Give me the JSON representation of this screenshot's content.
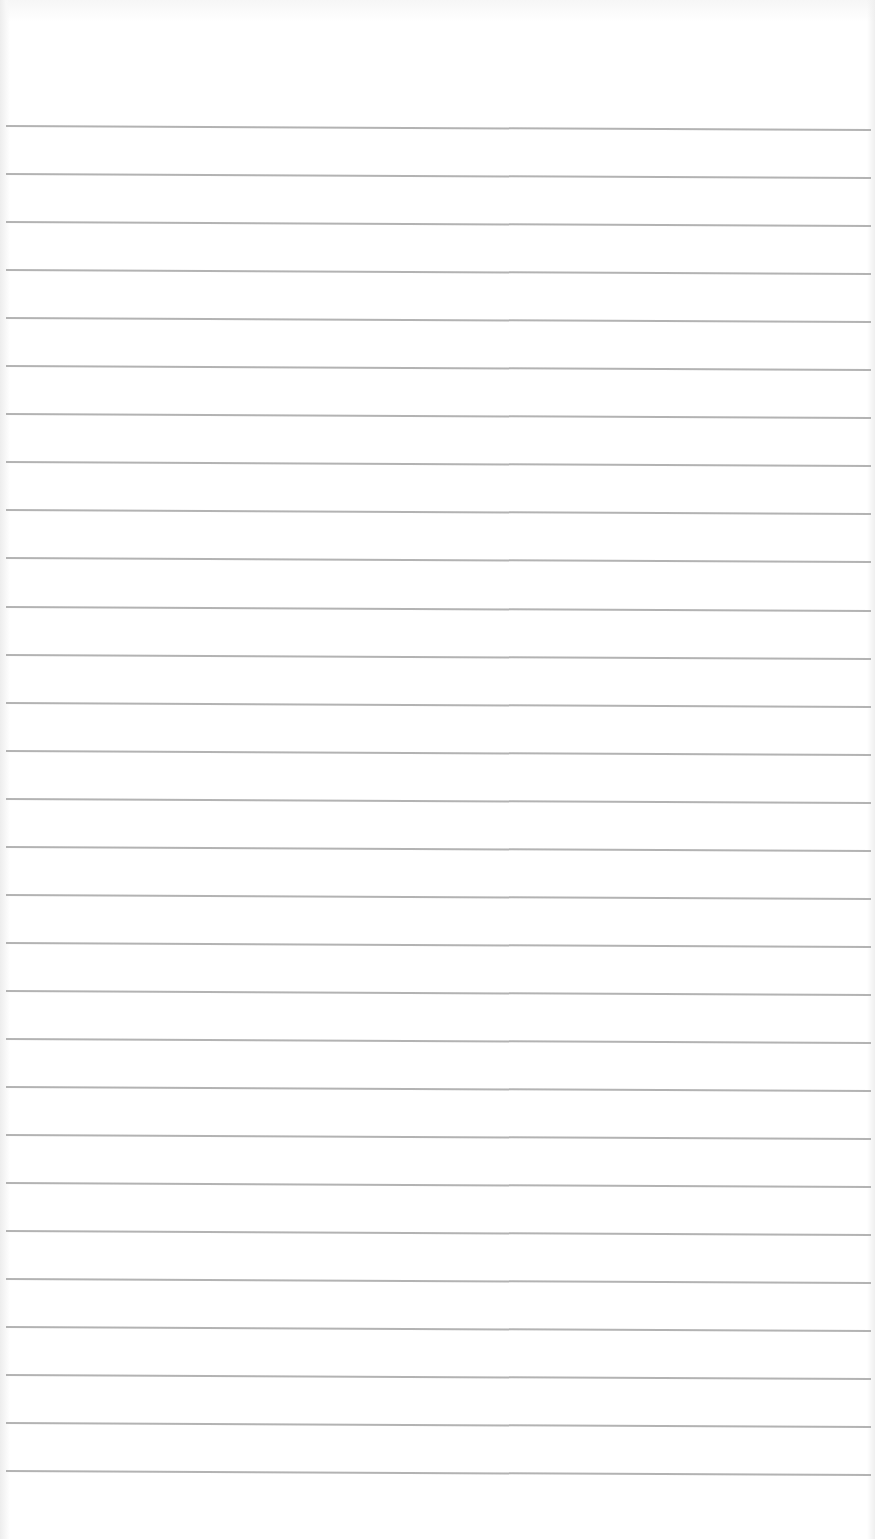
{
  "document": {
    "type": "ruled-paper",
    "background_color": "#ffffff",
    "line_color": "#ababab",
    "line_count": 29,
    "first_line_y": 125,
    "line_spacing_px": 48,
    "lines": [
      {
        "index": 1,
        "text": ""
      },
      {
        "index": 2,
        "text": ""
      },
      {
        "index": 3,
        "text": ""
      },
      {
        "index": 4,
        "text": ""
      },
      {
        "index": 5,
        "text": ""
      },
      {
        "index": 6,
        "text": ""
      },
      {
        "index": 7,
        "text": ""
      },
      {
        "index": 8,
        "text": ""
      },
      {
        "index": 9,
        "text": ""
      },
      {
        "index": 10,
        "text": ""
      },
      {
        "index": 11,
        "text": ""
      },
      {
        "index": 12,
        "text": ""
      },
      {
        "index": 13,
        "text": ""
      },
      {
        "index": 14,
        "text": ""
      },
      {
        "index": 15,
        "text": ""
      },
      {
        "index": 16,
        "text": ""
      },
      {
        "index": 17,
        "text": ""
      },
      {
        "index": 18,
        "text": ""
      },
      {
        "index": 19,
        "text": ""
      },
      {
        "index": 20,
        "text": ""
      },
      {
        "index": 21,
        "text": ""
      },
      {
        "index": 22,
        "text": ""
      },
      {
        "index": 23,
        "text": ""
      },
      {
        "index": 24,
        "text": ""
      },
      {
        "index": 25,
        "text": ""
      },
      {
        "index": 26,
        "text": ""
      },
      {
        "index": 27,
        "text": ""
      },
      {
        "index": 28,
        "text": ""
      },
      {
        "index": 29,
        "text": ""
      }
    ]
  }
}
